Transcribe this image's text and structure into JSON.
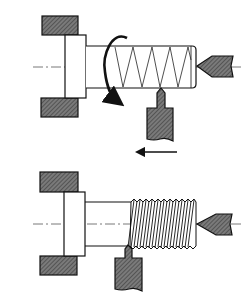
{
  "diagram": {
    "title": "Thread cutting on a lathe",
    "colors": {
      "background": "#ffffff",
      "outline": "#1a1a1a",
      "hatch_fill": "#6e6e6e",
      "hatch_line": "#3a3a3a",
      "centerline": "#555555"
    },
    "panels": [
      {
        "id": "before",
        "label": "Workpiece before thread cutting (helix path shown)",
        "elements": [
          "chuck-jaw-top",
          "chuck-body",
          "chuck-jaw-bottom",
          "workpiece-shaft",
          "helix-path",
          "rotation-arrow",
          "tailstock-center",
          "cutting-tool",
          "feed-arrow"
        ]
      },
      {
        "id": "after",
        "label": "Workpiece after thread cutting",
        "elements": [
          "chuck-jaw-top",
          "chuck-body",
          "chuck-jaw-bottom",
          "workpiece-shaft",
          "thread-teeth",
          "tailstock-center",
          "cutting-tool"
        ]
      }
    ],
    "annotations": {
      "rotation": "workpiece rotates",
      "feed_direction": "tool feed toward chuck (leftward)"
    }
  }
}
